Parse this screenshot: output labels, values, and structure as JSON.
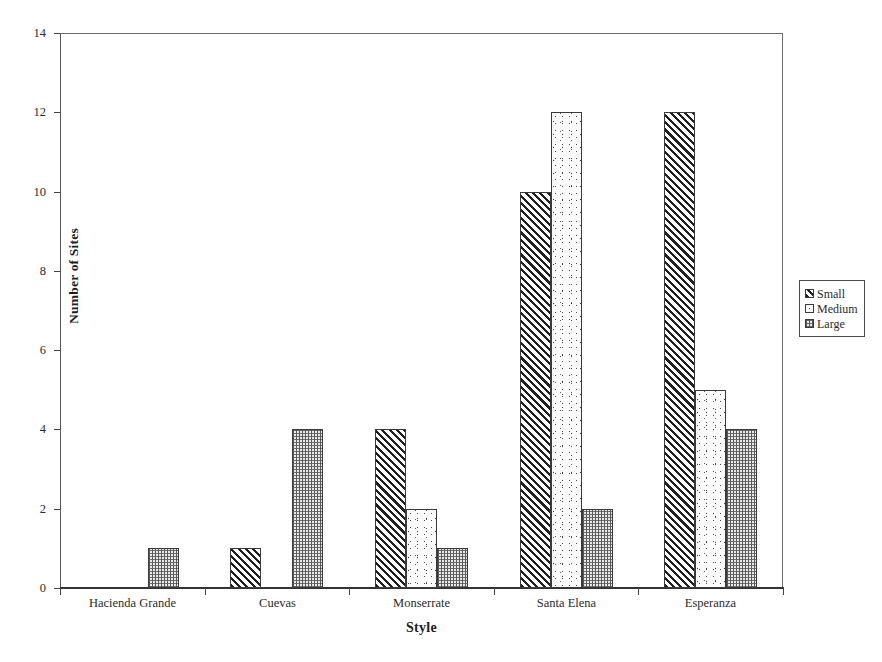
{
  "chart_data": {
    "type": "bar",
    "title": "",
    "xlabel": "Style",
    "ylabel": "Number of Sites",
    "ylim": [
      0,
      14
    ],
    "yticks": [
      0,
      2,
      4,
      6,
      8,
      10,
      12,
      14
    ],
    "grid": false,
    "legend_position": "right-outside",
    "categories": [
      "Hacienda Grande",
      "Cuevas",
      "Monserrate",
      "Santa Elena",
      "Esperanza"
    ],
    "series": [
      {
        "name": "Small",
        "pattern": "diagonal-hatch",
        "values": [
          0,
          1,
          4,
          10,
          12
        ]
      },
      {
        "name": "Medium",
        "pattern": "speckle-dots",
        "values": [
          0,
          0,
          2,
          12,
          5
        ]
      },
      {
        "name": "Large",
        "pattern": "fine-grid-dots",
        "values": [
          1,
          4,
          1,
          2,
          4
        ]
      }
    ]
  },
  "axes": {
    "y_title": "Number of Sites",
    "x_title": "Style",
    "y_tick_labels": [
      "0",
      "2",
      "4",
      "6",
      "8",
      "10",
      "12",
      "14"
    ],
    "x_tick_labels": [
      "Hacienda Grande",
      "Cuevas",
      "Monserrate",
      "Santa Elena",
      "Esperanza"
    ]
  },
  "legend": {
    "items": [
      {
        "label": "Small"
      },
      {
        "label": "Medium"
      },
      {
        "label": "Large"
      }
    ]
  },
  "colors": {
    "frame": "#555555",
    "axis": "#333333",
    "text": "#2b2b2b",
    "bar_outline": "#3a3a3a",
    "background": "#ffffff"
  }
}
